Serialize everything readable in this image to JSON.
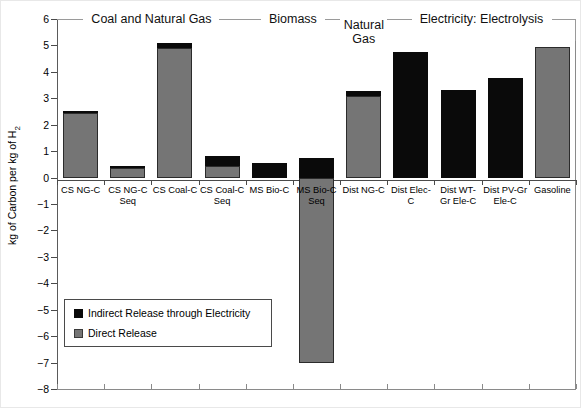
{
  "chart_data": {
    "type": "bar",
    "title": "",
    "xlabel": "",
    "ylabel": "kg of Carbon per kg of H2",
    "ylabel_rich": "kg of Carbon per kg of H₂",
    "ylim": [
      -8,
      6
    ],
    "ytick_values": [
      6,
      5,
      4,
      3,
      2,
      1,
      0,
      -1,
      -2,
      -3,
      -4,
      -5,
      -6,
      -7,
      -8
    ],
    "ytick_labels": [
      "6",
      "5",
      "4",
      "3",
      "2",
      "1",
      "0",
      "−1",
      "−2",
      "−3",
      "−4",
      "−5",
      "−6",
      "−7",
      "−8"
    ],
    "grid": false,
    "stacked": true,
    "legend_position": "inside-lower-left",
    "categories": [
      "CS NG-C",
      "CS NG-C Seq",
      "CS Coal-C",
      "CS Coal-C Seq",
      "MS Bio-C",
      "MS Bio-C Seq",
      "Dist NG-C",
      "Dist Elec-C",
      "Dist WT-Gr Ele-C",
      "Dist PV-Gr Ele-C",
      "Gasoline"
    ],
    "category_lines": [
      [
        "CS NG-C"
      ],
      [
        "CS NG-C",
        "Seq"
      ],
      [
        "CS Coal-C"
      ],
      [
        "CS Coal-C",
        "Seq"
      ],
      [
        "MS Bio-C"
      ],
      [
        "MS Bio-C",
        "Seq"
      ],
      [
        "Dist NG-C"
      ],
      [
        "Dist Elec-",
        "C"
      ],
      [
        "Dist WT-",
        "Gr Ele-C"
      ],
      [
        "Dist PV-Gr",
        "Ele-C"
      ],
      [
        "Gasoline"
      ]
    ],
    "series": [
      {
        "name": "Direct Release",
        "color": "#757575",
        "values": [
          2.45,
          0.38,
          4.9,
          0.45,
          0.0,
          -7.0,
          3.1,
          0.0,
          0.0,
          0.0,
          4.95
        ]
      },
      {
        "name": "Indirect Release through Electricity",
        "color": "#0a0a0a",
        "values": [
          0.07,
          0.05,
          0.2,
          0.35,
          0.55,
          0.75,
          0.17,
          4.75,
          3.3,
          3.75,
          0.0
        ]
      }
    ],
    "bar_totals_positive": [
      2.52,
      0.43,
      5.1,
      0.8,
      0.55,
      0.75,
      3.27,
      4.75,
      3.3,
      3.75,
      4.95
    ],
    "groups": [
      {
        "label": "Coal and Natural Gas",
        "label_lines": [
          "Coal and Natural Gas"
        ],
        "first": 0,
        "last": 3
      },
      {
        "label": "Biomass",
        "label_lines": [
          "Biomass"
        ],
        "first": 4,
        "last": 5
      },
      {
        "label": "Natural Gas",
        "label_lines": [
          "Natural",
          "Gas"
        ],
        "first": 6,
        "last": 6
      },
      {
        "label": "Electricity:  Electrolysis",
        "label_lines": [
          "Electricity:  Electrolysis"
        ],
        "first": 7,
        "last": 10
      }
    ],
    "legend": {
      "entries": [
        {
          "label": "Indirect Release through Electricity",
          "color": "#0a0a0a"
        },
        {
          "label": "Direct Release",
          "color": "#757575"
        }
      ]
    }
  }
}
